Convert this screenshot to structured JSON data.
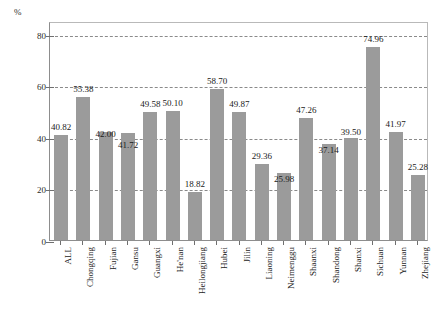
{
  "chart_data": {
    "type": "bar",
    "title": "",
    "xlabel": "",
    "ylabel": "%",
    "unit_label": "%",
    "ylim": [
      0,
      85
    ],
    "yticks": [
      0,
      20,
      40,
      60,
      80
    ],
    "gridlines": [
      20,
      40,
      60,
      80
    ],
    "grid": true,
    "grid_style": "dashed",
    "legend": null,
    "bar_color": "#9b9b9b",
    "categories": [
      "ALL",
      "Chongqing",
      "Fujian",
      "Gansu",
      "Guangxi",
      "He'nan",
      "Heilongjiang",
      "Hubei",
      "Jilin",
      "Liaoning",
      "Neimenggu",
      "Shaanxi",
      "Shandong",
      "Shanxi",
      "Sichuan",
      "Yunnan",
      "Zhejiang"
    ],
    "values": [
      40.82,
      55.38,
      42.0,
      41.72,
      49.58,
      50.1,
      18.82,
      58.7,
      49.87,
      29.36,
      25.98,
      47.26,
      37.14,
      39.5,
      74.96,
      41.97,
      25.28
    ],
    "value_labels": [
      "40.82",
      "55.38",
      "42.00",
      "41.72",
      "49.58",
      "50.10",
      "18.82",
      "58.70",
      "49.87",
      "29.36",
      "25.98",
      "47.26",
      "37.14",
      "39.50",
      "74.96",
      "41.97",
      "25.28"
    ],
    "ytick_labels": [
      "0",
      "20",
      "40",
      "60",
      "80"
    ]
  }
}
